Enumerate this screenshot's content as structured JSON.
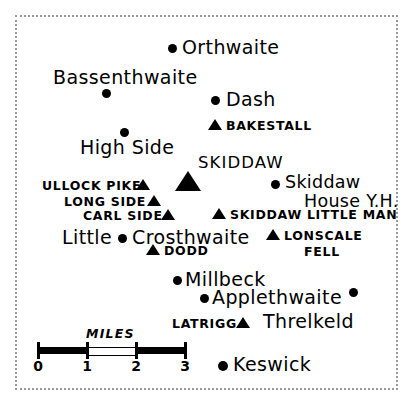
{
  "map": {
    "region_style": "hand-drawn sketch map",
    "frame": {
      "style": "dotted",
      "color": "#9a9a9a"
    },
    "ink_color": "#000000",
    "background_color": "#ffffff",
    "settlements": [
      {
        "name": "Orthwaite",
        "symbol": "dot"
      },
      {
        "name": "Bassenthwaite",
        "symbol": "dot"
      },
      {
        "name": "Dash",
        "symbol": "dot"
      },
      {
        "name": "High Side",
        "symbol": "dot"
      },
      {
        "name": "Skiddaw",
        "symbol": "dot"
      },
      {
        "name": "House Y.H.",
        "symbol": "none"
      },
      {
        "name": "Little",
        "symbol": "none"
      },
      {
        "name": "Crosthwaite",
        "symbol": "dot"
      },
      {
        "name": "Millbeck",
        "symbol": "dot"
      },
      {
        "name": "Applethwaite",
        "symbol": "dot"
      },
      {
        "name": "Threlkeld",
        "symbol": "dot"
      },
      {
        "name": "Keswick",
        "symbol": "dot"
      }
    ],
    "fells": [
      {
        "name": "BAKESTALL",
        "symbol": "triangle"
      },
      {
        "name": "SKIDDAW",
        "symbol": "triangle-large"
      },
      {
        "name": "ULLOCK PIKE",
        "symbol": "triangle"
      },
      {
        "name": "LONG SIDE",
        "symbol": "triangle"
      },
      {
        "name": "CARL SIDE",
        "symbol": "triangle"
      },
      {
        "name": "SKIDDAW LITTLE MAN",
        "symbol": "triangle"
      },
      {
        "name": "LONSCALE",
        "symbol": "triangle"
      },
      {
        "name": "FELL",
        "symbol": "none"
      },
      {
        "name": "DODD",
        "symbol": "triangle"
      },
      {
        "name": "LATRIGG",
        "symbol": "triangle"
      }
    ],
    "scale": {
      "title": "MILES",
      "ticks": [
        "0",
        "1",
        "2",
        "3"
      ],
      "segments": [
        "black",
        "white",
        "black"
      ],
      "units": "miles",
      "length_units": 3
    }
  }
}
